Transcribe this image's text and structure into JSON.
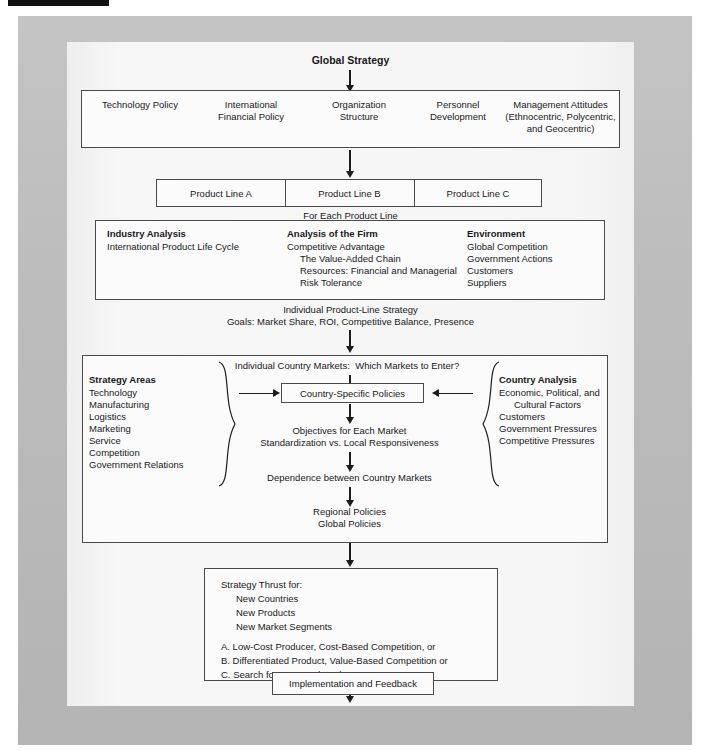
{
  "diagram": {
    "title": "Global Strategy",
    "top_row": [
      "Technology Policy",
      "International\nFinancial Policy",
      "Organization\nStructure",
      "Personnel\nDevelopment",
      "Management Attitudes\n(Ethnocentric, Polycentric,\nand Geocentric)"
    ],
    "product_lines": [
      "Product Line A",
      "Product Line B",
      "Product Line C"
    ],
    "for_each_product_line": "For Each Product Line",
    "analysis": {
      "industry_heading": "Industry Analysis",
      "industry_items": [
        "International Product Life Cycle"
      ],
      "firm_heading": "Analysis of the Firm",
      "firm_items": [
        "Competitive Advantage",
        "The Value-Added Chain",
        "Resources: Financial and Managerial",
        "Risk Tolerance"
      ],
      "environment_heading": "Environment",
      "environment_items": [
        "Global Competition",
        "Government Actions",
        "Customers",
        "Suppliers"
      ]
    },
    "product_line_strategy_line1": "Individual Product-Line Strategy",
    "product_line_strategy_line2": "Goals: Market Share, ROI, Competitive Balance, Presence",
    "country_block": {
      "top_question": "Individual Country Markets:  Which Markets to Enter?",
      "strategy_areas_heading": "Strategy Areas",
      "strategy_areas_items": [
        "Technology",
        "Manufacturing",
        "Logistics",
        "Marketing",
        "Service",
        "Competition",
        "Government Relations"
      ],
      "country_analysis_heading": "Country Analysis",
      "country_analysis_items": [
        "Economic, Political, and",
        "Cultural Factors",
        "Customers",
        "Government Pressures",
        "Competitive Pressures"
      ],
      "center_box": "Country-Specific Policies",
      "objectives_line1": "Objectives for Each Market",
      "objectives_line2": "Standardization vs. Local Responsiveness",
      "dependence": "Dependence between Country Markets",
      "regional_policies": "Regional Policies",
      "global_policies": "Global Policies"
    },
    "thrust": {
      "heading": "Strategy Thrust for:",
      "items": [
        "New Countries",
        "New Products",
        "New Market Segments"
      ],
      "options": [
        "A. Low-Cost Producer, Cost-Based Competition, or",
        "B. Differentiated Product, Value-Based Competition or",
        "C. Search for Protected Markets"
      ]
    },
    "implementation": "Implementation and Feedback",
    "colors": {
      "page_frame": "#bdbdbd",
      "sheet": "#f4f4f4",
      "stroke": "#4a4a4a",
      "text": "#18181a"
    }
  }
}
